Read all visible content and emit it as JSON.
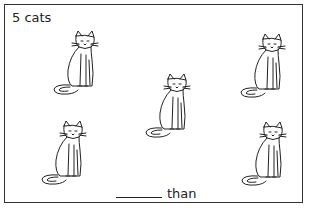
{
  "worksheet": {
    "title": "5 cats",
    "answer_prompt": "than",
    "answer_blank": "",
    "cats": [
      {
        "x": 48,
        "y": 30
      },
      {
        "x": 235,
        "y": 33
      },
      {
        "x": 140,
        "y": 73
      },
      {
        "x": 36,
        "y": 120
      },
      {
        "x": 236,
        "y": 121
      }
    ]
  }
}
